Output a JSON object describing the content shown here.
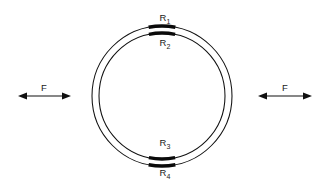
{
  "figure": {
    "background_color": "#ffffff",
    "line_color": "#101010",
    "gauge_color": "#0a0a0a",
    "width": 329,
    "height": 191
  },
  "ring": {
    "center_x": 162,
    "center_y": 96,
    "outer_radius": 70,
    "inner_radius": 63,
    "description": "annular ring drawn as two concentric circles"
  },
  "gauges": [
    {
      "id": "R1",
      "label_base": "R",
      "label_subscript": "1",
      "position": "outer-top",
      "label_x": 165,
      "label_y": 21,
      "arc_center_angle_deg": 270,
      "arc_half_span_deg": 11,
      "radius": 70
    },
    {
      "id": "R2",
      "label_base": "R",
      "label_subscript": "2",
      "position": "inner-top",
      "label_x": 165,
      "label_y": 46,
      "arc_center_angle_deg": 270,
      "arc_half_span_deg": 12,
      "radius": 63
    },
    {
      "id": "R3",
      "label_base": "R",
      "label_subscript": "3",
      "position": "inner-bottom",
      "label_x": 165,
      "label_y": 146,
      "arc_center_angle_deg": 90,
      "arc_half_span_deg": 12,
      "radius": 63
    },
    {
      "id": "R4",
      "label_base": "R",
      "label_subscript": "4",
      "position": "outer-bottom",
      "label_x": 165,
      "label_y": 176,
      "arc_center_angle_deg": 90,
      "arc_half_span_deg": 11,
      "radius": 70
    }
  ],
  "forces": [
    {
      "id": "F-left",
      "label": "F",
      "label_x": 44,
      "label_y": 91,
      "line_y": 96,
      "x_start": 18,
      "x_end": 71,
      "arrowheads": "both",
      "side": "left"
    },
    {
      "id": "F-right",
      "label": "F",
      "label_x": 285,
      "label_y": 91,
      "line_y": 96,
      "x_start": 258,
      "x_end": 312,
      "arrowheads": "both",
      "side": "right"
    }
  ]
}
